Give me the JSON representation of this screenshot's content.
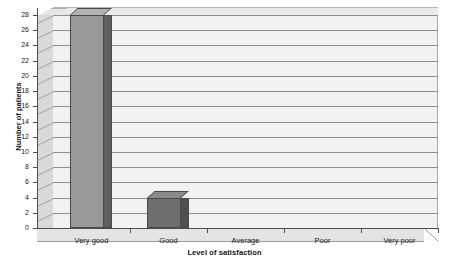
{
  "chart_data": {
    "type": "bar",
    "title": "",
    "subtitle": "",
    "xlabel": "Level of satisfaction",
    "ylabel": "Number of patients",
    "categories": [
      "Very good",
      "Good",
      "Average",
      "Poor",
      "Very poor"
    ],
    "values": [
      28,
      4,
      0,
      0,
      0
    ],
    "series": [
      {
        "name": "Number of patients",
        "values": [
          28,
          4,
          0,
          0,
          0
        ]
      }
    ],
    "ylim": [
      0,
      28
    ],
    "ytick_step": 2,
    "yticks": [
      0,
      2,
      4,
      6,
      8,
      10,
      12,
      14,
      16,
      18,
      20,
      22,
      24,
      26,
      28
    ],
    "ytick_labels": [
      "0",
      "2",
      "4",
      "6",
      "8",
      "10",
      "12",
      "14",
      "16",
      "18",
      "20",
      "22",
      "24",
      "26",
      "28"
    ],
    "grid": true,
    "grid_axis": "y",
    "legend": false,
    "legend_position": "none",
    "style": "3d",
    "annotations": [],
    "colors": {
      "bar_very_good": "#999999",
      "bar_good": "#6e6e6e",
      "bar_side_very_good": "#5e5e5e",
      "bar_side_good": "#4f4f4f",
      "bar_top_very_good": "#b3b3b3",
      "bar_top_good": "#8a8a8a",
      "bar_outline": "#4a4a4a",
      "plot_background": "#f2f2f2",
      "side_wall": "#d9d9d9",
      "floor": "#e4e4e4",
      "gridline": "#8f8f8f",
      "axis": "#4d4d4d",
      "text": "#1a1a1a"
    }
  }
}
